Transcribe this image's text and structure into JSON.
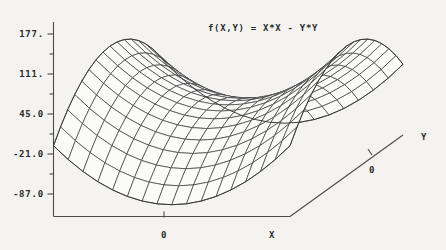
{
  "chart_data": {
    "type": "line",
    "render_style": "3d-wireframe-surface",
    "title": "f(X,Y) = X*X - Y*Y",
    "xlabel": "X",
    "ylabel": "Y",
    "zlabel": "",
    "grid": false,
    "legend": null,
    "surface": {
      "expression": "x*x - y*y",
      "x_range": [
        -10,
        10
      ],
      "y_range": [
        -10,
        10
      ],
      "mesh_nx": 17,
      "mesh_ny": 17
    },
    "z_axis": {
      "tick_labels": [
        "177.",
        "111.",
        "45.0",
        "-21.0",
        "-87.0"
      ],
      "tick_values": [
        177,
        111,
        45,
        -21,
        -87
      ],
      "minor_ticks_between": 1,
      "zlim": [
        -120,
        210
      ]
    },
    "x_axis": {
      "tick_labels": [
        "0"
      ],
      "tick_values": [
        0
      ],
      "axis_title": "X"
    },
    "y_axis": {
      "tick_labels": [
        "0"
      ],
      "tick_values": [
        0
      ],
      "axis_title": "Y"
    },
    "colors": {
      "background": "#f4f3f1",
      "ink": "#2b2b2b",
      "mesh": "#3a3a3a",
      "surface_fill": "#fbfbfa"
    }
  },
  "plot": {
    "title": "f(X,Y) = X*X - Y*Y",
    "z_ticks": [
      {
        "label": "177."
      },
      {
        "label": "111."
      },
      {
        "label": "45.0"
      },
      {
        "label": "-21.0"
      },
      {
        "label": "-87.0"
      }
    ],
    "x_tick_label": "0",
    "x_axis_title": "X",
    "y_tick_label": "0",
    "y_axis_title": "Y"
  }
}
